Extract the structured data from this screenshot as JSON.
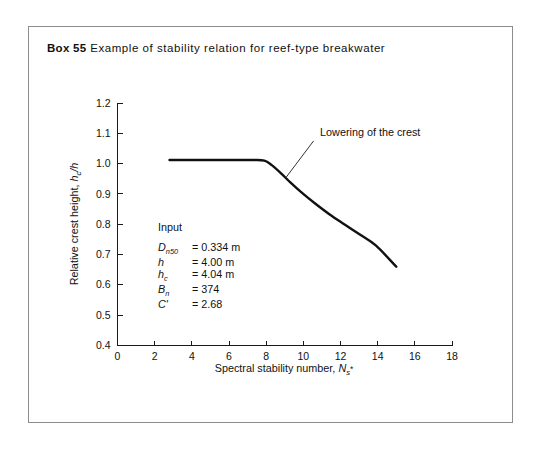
{
  "caption": {
    "box_label": "Box 55",
    "title": "Example of stability relation for reef-type breakwater"
  },
  "input_panel": {
    "heading": "Input",
    "rows": [
      {
        "symbol": "D",
        "symbol_sub": "n50",
        "symbol_prime": "",
        "equals": "=",
        "value": "0.334 m"
      },
      {
        "symbol": "h",
        "symbol_sub": "",
        "symbol_prime": "",
        "equals": "=",
        "value": "4.00 m"
      },
      {
        "symbol": "h",
        "symbol_sub": "c",
        "symbol_prime": "",
        "equals": "=",
        "value": "4.04 m"
      },
      {
        "symbol": "B",
        "symbol_sub": "n",
        "symbol_prime": "",
        "equals": "=",
        "value": "374"
      },
      {
        "symbol": "C",
        "symbol_sub": "",
        "symbol_prime": "'",
        "equals": "=",
        "value": "2.68"
      }
    ]
  },
  "annotation": {
    "text": "Lowering of the crest"
  },
  "chart_data": {
    "type": "line",
    "title": "Example of stability relation for reef-type breakwater",
    "xlabel": "Spectral stability number, Ns*",
    "ylabel": "Relative crest height, hc/h",
    "xlabel_parts": {
      "main": "Spectral stability number, ",
      "sym": "N",
      "sub": "s",
      "sup": "*"
    },
    "ylabel_parts": {
      "main": "Relative crest height, ",
      "sym": "h",
      "sub": "c",
      "tail": "/h"
    },
    "xlim": [
      0,
      18
    ],
    "ylim": [
      0.4,
      1.2
    ],
    "xticks": [
      0,
      2,
      4,
      6,
      8,
      10,
      12,
      14,
      16,
      18
    ],
    "xtick_labels": [
      "0",
      "2",
      "4",
      "6",
      "8",
      "10",
      "12",
      "14",
      "16",
      "18"
    ],
    "yticks": [
      0.4,
      0.5,
      0.6,
      0.7,
      0.8,
      0.9,
      1.0,
      1.1,
      1.2
    ],
    "ytick_labels": [
      "0.4",
      "0.5",
      "0.6",
      "0.7",
      "0.8",
      "0.9",
      "1.0",
      "1.1",
      "1.2"
    ],
    "grid": false,
    "legend": false,
    "series": [
      {
        "name": "Relative crest height",
        "x": [
          2.8,
          3.5,
          4.5,
          5.5,
          6.5,
          7.3,
          7.9,
          8.3,
          8.8,
          9.3,
          9.9,
          10.6,
          11.4,
          12.2,
          13.0,
          13.9,
          15.0
        ],
        "y": [
          1.012,
          1.012,
          1.012,
          1.012,
          1.012,
          1.012,
          1.01,
          0.995,
          0.968,
          0.938,
          0.905,
          0.87,
          0.833,
          0.8,
          0.768,
          0.73,
          0.66
        ]
      }
    ],
    "annotations": [
      {
        "text": "Lowering of the crest",
        "text_x": 10.9,
        "text_y": 1.09,
        "arrow_from_x": 10.55,
        "arrow_from_y": 1.075,
        "arrow_to_x": 9.05,
        "arrow_to_y": 0.953
      }
    ]
  }
}
